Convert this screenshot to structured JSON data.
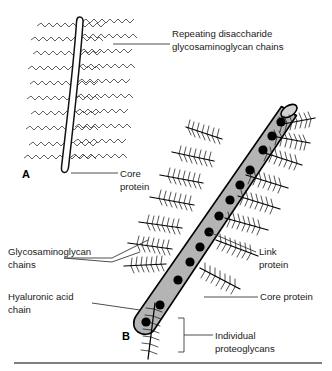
{
  "figure": {
    "background_color": "#ffffff",
    "width": 332,
    "height": 371
  },
  "panels": [
    {
      "id": "A",
      "letter": "A",
      "description": "Single proteoglycan monomer: core protein with repeating disaccharide glycosaminoglycan chains"
    },
    {
      "id": "B",
      "letter": "B",
      "description": "Proteoglycan aggregate: hyaluronic acid chain with link proteins binding individual proteoglycans"
    }
  ],
  "labels": {
    "repeating_disaccharide": {
      "line1": "Repeating disaccharide",
      "line2": "glycosaminoglycan chains"
    },
    "core_protein_a": {
      "line1": "Core",
      "line2": "protein"
    },
    "glycosaminoglycan_chains": {
      "line1": "Glycosaminoglycan",
      "line2": "chains"
    },
    "hyaluronic_acid_chain": {
      "line1": "Hyaluronic acid",
      "line2": "chain"
    },
    "link_protein": {
      "line1": "Link",
      "line2": "protein"
    },
    "core_protein_b": {
      "line1": "Core protein"
    },
    "individual_proteoglycans": {
      "line1": "Individual",
      "line2": "proteoglycans"
    }
  },
  "colors": {
    "hyaluronic_cylinder": "#b4b4b4",
    "cylinder_cap": "#d2d2d2",
    "link_protein_dot": "#000000",
    "core_protein_fill": "#ffffff",
    "outline": "#000000",
    "label_text": "#1a1a1a",
    "leader_line": "#3a3a3a",
    "bottom_rule": "#555555"
  },
  "counts": {
    "gag_chains_panel_a": 18,
    "link_protein_dots": 12,
    "proteoglycans_panel_b": 11
  }
}
